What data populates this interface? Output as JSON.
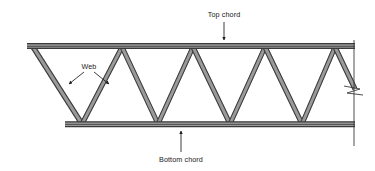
{
  "diagram": {
    "background_color": "#ffffff",
    "member_color": "#3a3a3a",
    "member_fill_color": "#9a9a9a",
    "annotation_color": "#1a1a1a",
    "width": 375,
    "height": 171
  },
  "labels": {
    "top_chord": "Top chord",
    "bottom_chord": "Bottom chord",
    "web": "Web"
  },
  "geometry": {
    "top_chord": {
      "x1": 27,
      "x2": 355,
      "y": 46
    },
    "bottom_chord": {
      "x1": 65,
      "x2": 355,
      "y": 124
    },
    "top_vertices_x": [
      33,
      122,
      193,
      265,
      335
    ],
    "bottom_vertices_x": [
      82,
      158,
      230,
      302
    ],
    "break_line": {
      "x": 354,
      "y1": 40,
      "y2": 146
    },
    "break_symbol_y": 90
  },
  "annotations": {
    "top_chord_leader": {
      "x": 224,
      "y_from": 26,
      "y_to": 44,
      "arrow": "down"
    },
    "bottom_chord_leader": {
      "x": 181,
      "y_from": 146,
      "y_to": 129,
      "arrow": "up"
    },
    "web_leader_left": {
      "x_from": 84,
      "y_from": 70,
      "x_to": 68,
      "y_to": 83,
      "arrow": "down-left"
    },
    "web_leader_right": {
      "x_from": 94,
      "y_from": 70,
      "x_to": 110,
      "y_to": 83,
      "arrow": "down-right"
    }
  }
}
